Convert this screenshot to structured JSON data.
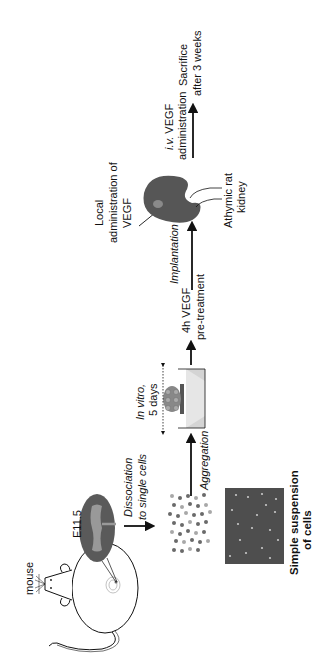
{
  "diagram": {
    "orientation": "rotated-90-ccw",
    "colors": {
      "ink": "#111111",
      "tissue": "#5a5a5a",
      "tissue_light": "#9a9a9a",
      "cell_dark": "#6a6a6a",
      "cell_light": "#a8a8a8",
      "micrograph_bg": "#4e4e4e",
      "micrograph_cell": "#c8c8c8",
      "dish_fill": "#d4d4d4",
      "kidney_fill": "#565656"
    },
    "nodes": {
      "mouse": {
        "label": "mouse",
        "icon": "mouse-icon"
      },
      "embryo": {
        "label": "E11.5",
        "icon": "embryo-icon"
      },
      "cells": {
        "icon": "cell-dots-icon"
      },
      "micrograph": {
        "caption_line1": "Simple suspension",
        "caption_line2": "of cells",
        "icon": "micrograph-image"
      },
      "culture": {
        "label_line1": "In vitro,",
        "label_line2": "5 days",
        "icon": "culture-dish-icon"
      },
      "kidney": {
        "label_line1": "Athymic rat",
        "label_line2": "kidney",
        "icon": "kidney-icon"
      }
    },
    "steps": {
      "dissociation": {
        "line1": "Dissociation",
        "line2": "to single cells"
      },
      "aggregation": {
        "label": "Aggregation"
      },
      "pretreatment": {
        "line1": "4h VEGF",
        "line2": "pre-treatment"
      },
      "implantation": {
        "label": "Implantation"
      },
      "local_admin": {
        "line1": "Local",
        "line2": "administration of",
        "line3": "VEGF"
      },
      "iv_admin": {
        "line1_italic": "i.v.",
        "line1_rest": " VEGF",
        "line2": "administration"
      },
      "sacrifice": {
        "line1": "Sacrifice",
        "line2": "after 3 weeks"
      }
    }
  }
}
